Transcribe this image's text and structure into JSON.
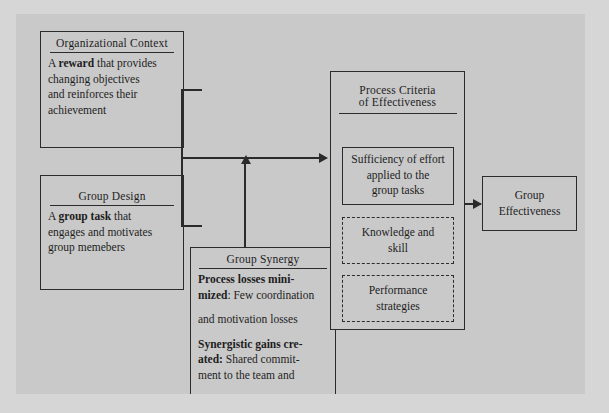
{
  "diagram": {
    "boxes": {
      "org_context": {
        "heading": "Organizational Context",
        "line1_bold_pre": "A ",
        "line1_bold": "reward",
        "line1_post": " that provides",
        "line2": "changing objectives",
        "line3": "and reinforces their",
        "line4": "achievement"
      },
      "group_design": {
        "heading": "Group Design",
        "line1_pre": "A ",
        "line1_bold": "group task",
        "line1_post": " that",
        "line2": "engages and motivates",
        "line3": "group memebers"
      },
      "group_synergy": {
        "heading": "Group Synergy",
        "p1_bold": "Process losses mini-",
        "p1_bold2": "mized",
        "p1_post": ": Few coordination",
        "p2": "and motivation losses",
        "p3_bold": "Synergistic gains cre-",
        "p3_bold2": "ated:",
        "p3_post": " Shared commit-",
        "p4": "ment to the team and"
      },
      "process_criteria": {
        "heading_line1": "Process Criteria",
        "heading_line2": "of Effectiveness",
        "sufficiency": {
          "line1": "Sufficiency of effort",
          "line2": "applied to the",
          "line3": "group tasks"
        },
        "knowledge": {
          "line1": "Knowledge and",
          "line2": "skill"
        },
        "performance": {
          "line1": "Performance",
          "line2": "strategies"
        }
      },
      "group_effectiveness": {
        "line1": "Group",
        "line2": "Effectiveness"
      }
    },
    "colors": {
      "panel_bg": "#c9c9c9",
      "page_bg": "#d6d6d6",
      "ink": "#2b2b2b"
    }
  }
}
